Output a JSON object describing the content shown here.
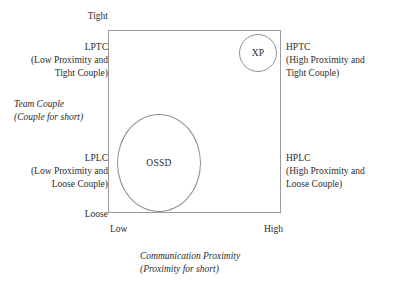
{
  "diagram": {
    "axes": {
      "y": {
        "caption_line1": "Team Couple",
        "caption_line2": "(Couple for short)",
        "high_tick": "Tight",
        "low_tick": "Loose"
      },
      "x": {
        "caption_line1": "Communication Proximity",
        "caption_line2": "(Proximity for short)",
        "low_tick": "Low",
        "high_tick": "High"
      }
    },
    "quadrants": [
      {
        "id": "lptc",
        "code": "LPTC",
        "expansion_line1": "(Low Proximity and",
        "expansion_line2": "Tight Couple)"
      },
      {
        "id": "hptc",
        "code": "HPTC",
        "expansion_line1": "(High Proximity and",
        "expansion_line2": "Tight Couple)"
      },
      {
        "id": "lplc",
        "code": "LPLC",
        "expansion_line1": "(Low Proximity and",
        "expansion_line2": "Loose Couple)"
      },
      {
        "id": "hplc",
        "code": "HPLC",
        "expansion_line1": "(High Proximity and",
        "expansion_line2": "Loose Couple)"
      }
    ],
    "shapes": [
      {
        "id": "xp",
        "label": "XP"
      },
      {
        "id": "ossd",
        "label": "OSSD"
      }
    ],
    "colors": {
      "background": "#ffffff",
      "text": "#2b2b2b",
      "box_border": "#9a9a9a",
      "shape_border": "#8f8f8f"
    }
  }
}
